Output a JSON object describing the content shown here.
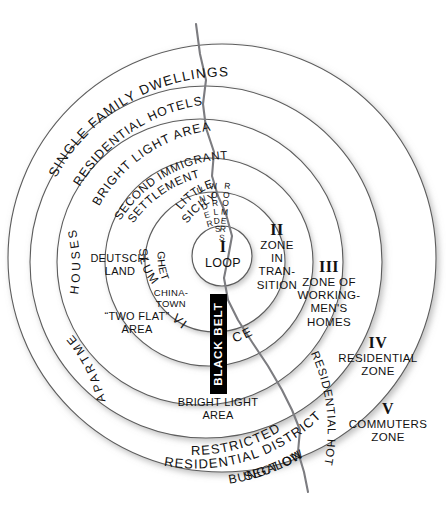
{
  "diagram": {
    "center_label": {
      "numeral": "I",
      "name": "LOOP"
    },
    "zones": [
      {
        "numeral": "I",
        "name": "LOOP"
      },
      {
        "numeral": "II",
        "name": "ZONE IN TRAN- SITION",
        "lines": [
          "ZONE",
          "IN",
          "TRAN-",
          "SITION"
        ]
      },
      {
        "numeral": "III",
        "name": "ZONE OF WORKING-MEN'S HOMES",
        "lines": [
          "ZONE OF",
          "WORKING-",
          "MEN'S",
          "HOMES"
        ]
      },
      {
        "numeral": "IV",
        "name": "RESIDENTIAL ZONE",
        "lines": [
          "RESIDENTIAL",
          "ZONE"
        ]
      },
      {
        "numeral": "V",
        "name": "COMMUTERS ZONE",
        "lines": [
          "COMMUTERS",
          "ZONE"
        ]
      }
    ],
    "inner_labels": {
      "little_sicily": "LITTLE SICILY",
      "underworld_1": "UNDER",
      "underworld_2": "WORLD",
      "roomers": "ROOMERS",
      "ghetto": "GHETTO",
      "slum": "SLUM",
      "chinatown_line1": "CHINA-",
      "chinatown_line2": "TOWN",
      "deutschland_line1": "DEUTSCH-",
      "deutschland_line2": "LAND",
      "two_flat_line1": "“TWO FLAT”",
      "two_flat_line2": "AREA",
      "vice_left": "VI",
      "vice_right": "CE",
      "black_belt": "BLACK BELT",
      "bright_light_inner_line1": "BRIGHT LIGHT",
      "bright_light_inner_line2": "AREA"
    },
    "arc_labels": {
      "single_family_dwellings": "SINGLE FAMILY DWELLINGS",
      "residential_hotels_top": "RESIDENTIAL HOTELS",
      "bright_light_area": "BRIGHT  LIGHT  AREA",
      "second_immigrant_line1": "SECOND IMMIGRANT",
      "second_immigrant_line2": "SETTLEMENT",
      "apartment": "APARTMENT",
      "houses": "HOUSES",
      "restricted_line1": "RESTRICTED",
      "restricted_line2": "RESIDENTIAL DISTRICT",
      "bungalow_line1": "BUNGALOW",
      "bungalow_line2": "SECTION",
      "residential_hotels_right": "RESIDENTIAL HOTELS"
    },
    "colors": {
      "ring_stroke": "#5d5d5d",
      "river": "#7c7c80",
      "black_belt_fill": "#000000",
      "black_belt_text": "#ffffff",
      "background": "#ffffff",
      "text": "#111111"
    }
  }
}
